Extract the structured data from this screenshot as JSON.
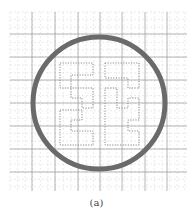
{
  "figure": {
    "caption": "(a)",
    "grid": {
      "x0": 10,
      "y0": 12,
      "x1": 187,
      "y1": 191,
      "major_x": [
        32,
        55,
        78,
        100,
        122,
        145,
        167
      ],
      "major_y": [
        34,
        57,
        80,
        103,
        126,
        149,
        172
      ],
      "minor_step": 7.6,
      "major_color": "#9a9a9a",
      "minor_color": "#dcdcdc"
    },
    "ring": {
      "cx": 99,
      "cy": 103,
      "r": 66,
      "stroke_width": 5,
      "color": "#6a6a6a"
    },
    "pattern": {
      "color": "#8a8a8a",
      "left_path": "M60 63 L93 63 L93 75 L71 75 L71 98 L82 98 L82 108 L93 108 L93 98 L93 88 L60 88 Z M60 110 L82 110 L82 120 L71 120 L71 131 L93 131 L93 145 L60 145 Z",
      "right_path": "M105 63 L139 63 L139 88 L128 88 L128 78 L105 78 Z M105 88 L117 88 L117 108 L128 108 L128 98 L139 98 L139 120 L128 120 L128 131 L139 131 L139 145 L105 145 Z"
    }
  }
}
